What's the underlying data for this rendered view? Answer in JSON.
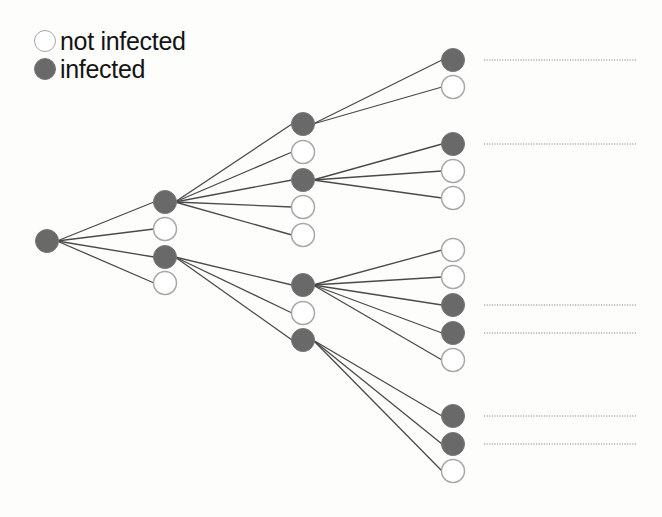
{
  "legend": {
    "items": [
      {
        "label": "not infected",
        "state": "open"
      },
      {
        "label": "infected",
        "state": "filled"
      }
    ]
  },
  "colors": {
    "filled": "#696969",
    "open_fill": "#ffffff",
    "open_stroke": "#a8a8a8",
    "edge": "#4a4a4a",
    "dotted": "#8a8a8a"
  },
  "tree": {
    "node_radius": 12,
    "nodes": [
      {
        "id": "root",
        "x": 47,
        "y": 241,
        "state": "filled"
      },
      {
        "id": "a",
        "x": 165,
        "y": 202,
        "state": "filled",
        "parent": "root"
      },
      {
        "id": "b",
        "x": 165,
        "y": 229,
        "state": "open",
        "parent": "root"
      },
      {
        "id": "c",
        "x": 165,
        "y": 257,
        "state": "filled",
        "parent": "root"
      },
      {
        "id": "d",
        "x": 165,
        "y": 283,
        "state": "open",
        "parent": "root"
      },
      {
        "id": "a1",
        "x": 303,
        "y": 124,
        "state": "filled",
        "parent": "a"
      },
      {
        "id": "a2",
        "x": 303,
        "y": 152,
        "state": "open",
        "parent": "a"
      },
      {
        "id": "a3",
        "x": 303,
        "y": 180,
        "state": "filled",
        "parent": "a"
      },
      {
        "id": "a4",
        "x": 303,
        "y": 207,
        "state": "open",
        "parent": "a"
      },
      {
        "id": "a5",
        "x": 303,
        "y": 235,
        "state": "open",
        "parent": "a"
      },
      {
        "id": "c1",
        "x": 303,
        "y": 285,
        "state": "filled",
        "parent": "c"
      },
      {
        "id": "c2",
        "x": 303,
        "y": 313,
        "state": "open",
        "parent": "c"
      },
      {
        "id": "c3",
        "x": 303,
        "y": 340,
        "state": "filled",
        "parent": "c"
      },
      {
        "id": "a1a",
        "x": 453,
        "y": 60,
        "state": "filled",
        "parent": "a1",
        "dotted": true
      },
      {
        "id": "a1b",
        "x": 453,
        "y": 87,
        "state": "open",
        "parent": "a1"
      },
      {
        "id": "a3a",
        "x": 453,
        "y": 144,
        "state": "filled",
        "parent": "a3",
        "dotted": true
      },
      {
        "id": "a3b",
        "x": 453,
        "y": 171,
        "state": "open",
        "parent": "a3"
      },
      {
        "id": "a3c",
        "x": 453,
        "y": 198,
        "state": "open",
        "parent": "a3"
      },
      {
        "id": "c1a",
        "x": 453,
        "y": 250,
        "state": "open",
        "parent": "c1"
      },
      {
        "id": "c1b",
        "x": 453,
        "y": 277,
        "state": "open",
        "parent": "c1"
      },
      {
        "id": "c1c",
        "x": 453,
        "y": 305,
        "state": "filled",
        "parent": "c1",
        "dotted": true
      },
      {
        "id": "c1d",
        "x": 453,
        "y": 333,
        "state": "filled",
        "parent": "c1",
        "dotted": true
      },
      {
        "id": "c1e",
        "x": 453,
        "y": 360,
        "state": "open",
        "parent": "c1"
      },
      {
        "id": "c3a",
        "x": 453,
        "y": 416,
        "state": "filled",
        "parent": "c3",
        "dotted": true
      },
      {
        "id": "c3b",
        "x": 453,
        "y": 444,
        "state": "filled",
        "parent": "c3",
        "dotted": true
      },
      {
        "id": "c3c",
        "x": 453,
        "y": 471,
        "state": "open",
        "parent": "c3"
      }
    ],
    "dotted_line": {
      "x_start": 484,
      "x_end": 637
    }
  }
}
